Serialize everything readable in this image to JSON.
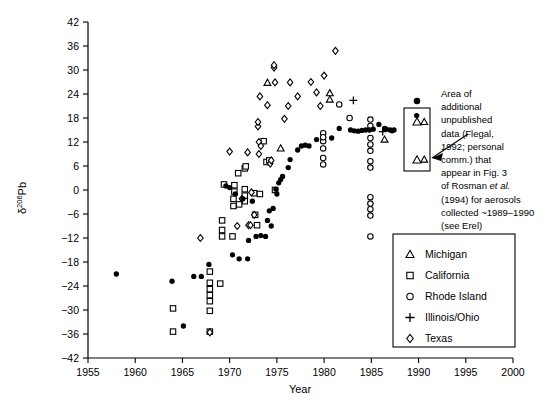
{
  "chart_data": {
    "type": "scatter",
    "title": "",
    "xlabel": "Year",
    "ylabel": "δ206Pb",
    "ylabel_base": "δ",
    "ylabel_sup": "206",
    "ylabel_tail": "Pb",
    "xlim": [
      1955,
      2000
    ],
    "ylim": [
      -42,
      42
    ],
    "xticks": [
      1955,
      1960,
      1965,
      1970,
      1975,
      1980,
      1985,
      1990,
      1995,
      2000
    ],
    "yticks": [
      -42,
      -36,
      -30,
      -24,
      -18,
      -12,
      -6,
      0,
      6,
      12,
      18,
      24,
      30,
      36,
      42
    ],
    "grid": false,
    "legend_position": "bottom-right",
    "series": [
      {
        "name": "Michigan",
        "marker": "triangle-open",
        "points": [
          [
            1974.0,
            26.8
          ],
          [
            1980.6,
            24.2
          ],
          [
            1980.6,
            22.6
          ],
          [
            1975.4,
            10.4
          ],
          [
            1986.4,
            12.6
          ],
          [
            1990.6,
            17.0
          ],
          [
            1990.6,
            7.6
          ]
        ]
      },
      {
        "name": "California",
        "marker": "square-open",
        "points": [
          [
            1964.0,
            -29.6
          ],
          [
            1964.0,
            -35.4
          ],
          [
            1967.9,
            -20.4
          ],
          [
            1967.9,
            -23.2
          ],
          [
            1967.9,
            -24.8
          ],
          [
            1967.9,
            -26.3
          ],
          [
            1967.9,
            -27.8
          ],
          [
            1967.9,
            -30.2
          ],
          [
            1967.9,
            -35.4
          ],
          [
            1969.0,
            -23.4
          ],
          [
            1969.2,
            -7.6
          ],
          [
            1969.2,
            -10.0
          ],
          [
            1969.2,
            -11.6
          ],
          [
            1970.3,
            -11.6
          ],
          [
            1970.4,
            -2.2
          ],
          [
            1970.4,
            -4.0
          ],
          [
            1970.5,
            -0.4
          ],
          [
            1970.5,
            1.2
          ],
          [
            1970.9,
            4.2
          ],
          [
            1971.6,
            0.2
          ],
          [
            1971.6,
            -1.4
          ],
          [
            1971.6,
            -2.8
          ],
          [
            1971.6,
            5.4
          ],
          [
            1971.7,
            5.9
          ],
          [
            1972.6,
            -0.8
          ],
          [
            1972.7,
            -6.2
          ],
          [
            1972.9,
            -8.8
          ],
          [
            1973.6,
            12.2
          ],
          [
            1973.9,
            7.0
          ],
          [
            1974.2,
            7.4
          ],
          [
            1969.4,
            1.4
          ],
          [
            1971.0,
            -3.6
          ],
          [
            1973.2,
            -1.0
          ],
          [
            1974.8,
            0.0
          ]
        ]
      },
      {
        "name": "Rhode Island",
        "marker": "circle-open",
        "points": [
          [
            1981.6,
            21.4
          ],
          [
            1982.7,
            18.0
          ],
          [
            1984.9,
            17.6
          ],
          [
            1984.9,
            16.0
          ],
          [
            1984.9,
            13.0
          ],
          [
            1984.9,
            11.4
          ],
          [
            1984.9,
            9.8
          ],
          [
            1984.9,
            7.2
          ],
          [
            1984.9,
            5.6
          ],
          [
            1984.9,
            -1.8
          ],
          [
            1984.9,
            -3.4
          ],
          [
            1984.9,
            -4.8
          ],
          [
            1984.9,
            -6.4
          ],
          [
            1984.9,
            -11.6
          ],
          [
            1979.9,
            14.2
          ],
          [
            1979.9,
            12.2
          ],
          [
            1979.9,
            10.4
          ],
          [
            1979.9,
            8.0
          ],
          [
            1979.9,
            6.4
          ],
          [
            1979.9,
            13.2
          ]
        ]
      },
      {
        "name": "Illinois/Ohio",
        "marker": "plus",
        "points": [
          [
            1983.1,
            22.4
          ],
          [
            1986.2,
            14.6
          ]
        ]
      },
      {
        "name": "Texas",
        "marker": "diamond-open",
        "points": [
          [
            1966.9,
            -12.0
          ],
          [
            1967.9,
            -35.6
          ],
          [
            1970.0,
            9.6
          ],
          [
            1971.9,
            9.4
          ],
          [
            1973.1,
            9.0
          ],
          [
            1973.1,
            12.0
          ],
          [
            1973.3,
            11.0
          ],
          [
            1973.0,
            15.9
          ],
          [
            1973.0,
            17.0
          ],
          [
            1973.2,
            23.4
          ],
          [
            1974.0,
            21.2
          ],
          [
            1974.7,
            30.6
          ],
          [
            1974.7,
            31.2
          ],
          [
            1974.8,
            26.9
          ],
          [
            1976.4,
            26.9
          ],
          [
            1974.3,
            6.6
          ],
          [
            1974.4,
            7.4
          ],
          [
            1972.3,
            -0.6
          ],
          [
            1972.6,
            -6.2
          ],
          [
            1972.0,
            -8.8
          ],
          [
            1972.2,
            -8.8
          ],
          [
            1970.8,
            -9.0
          ],
          [
            1971.3,
            -2.2
          ],
          [
            1980.0,
            28.6
          ],
          [
            1981.2,
            34.8
          ],
          [
            1979.2,
            24.4
          ],
          [
            1979.6,
            21.0
          ],
          [
            1978.6,
            27.0
          ],
          [
            1977.2,
            23.4
          ],
          [
            1976.2,
            21.0
          ],
          [
            1975.8,
            17.8
          ]
        ]
      },
      {
        "name": "Unlabeled filled circles",
        "marker": "circle-filled",
        "points": [
          [
            1958.0,
            -21.0
          ],
          [
            1963.9,
            -22.8
          ],
          [
            1965.1,
            -34.0
          ],
          [
            1966.2,
            -21.6
          ],
          [
            1967.0,
            -21.6
          ],
          [
            1967.8,
            -18.6
          ],
          [
            1970.3,
            -16.2
          ],
          [
            1971.0,
            -17.2
          ],
          [
            1971.9,
            -17.2
          ],
          [
            1972.0,
            -12.6
          ],
          [
            1972.8,
            -11.6
          ],
          [
            1973.3,
            -11.4
          ],
          [
            1973.8,
            -11.6
          ],
          [
            1974.2,
            -5.2
          ],
          [
            1974.6,
            -4.6
          ],
          [
            1974.9,
            0.2
          ],
          [
            1975.2,
            1.8
          ],
          [
            1975.4,
            2.6
          ],
          [
            1975.0,
            -1.0
          ],
          [
            1975.6,
            3.4
          ],
          [
            1976.2,
            5.6
          ],
          [
            1976.4,
            7.6
          ],
          [
            1974.0,
            -7.6
          ],
          [
            1974.4,
            -9.0
          ],
          [
            1977.2,
            10.0
          ],
          [
            1977.6,
            11.0
          ],
          [
            1978.0,
            11.2
          ],
          [
            1978.4,
            11.0
          ],
          [
            1979.2,
            12.6
          ],
          [
            1980.8,
            13.0
          ],
          [
            1981.6,
            15.4
          ],
          [
            1982.8,
            15.0
          ],
          [
            1983.2,
            14.8
          ],
          [
            1983.6,
            14.7
          ],
          [
            1984.0,
            14.9
          ],
          [
            1984.4,
            15.0
          ],
          [
            1984.8,
            15.0
          ],
          [
            1985.2,
            15.2
          ],
          [
            1985.8,
            16.4
          ],
          [
            1986.4,
            15.4
          ],
          [
            1986.6,
            15.2
          ],
          [
            1987.0,
            15.0
          ],
          [
            1987.2,
            14.8
          ],
          [
            1987.4,
            15.0
          ],
          [
            1989.8,
            18.6
          ],
          [
            1969.6,
            1.0
          ],
          [
            1970.0,
            0.6
          ],
          [
            1971.4,
            -2.2
          ],
          [
            1972.4,
            -2.8
          ],
          [
            1970.6,
            -1.0
          ]
        ]
      }
    ]
  },
  "legend": {
    "items": [
      {
        "label": "Michigan",
        "marker": "triangle-open"
      },
      {
        "label": "California",
        "marker": "square-open"
      },
      {
        "label": "Rhode Island",
        "marker": "circle-open"
      },
      {
        "label": "Illinois/Ohio",
        "marker": "plus"
      },
      {
        "label": "Texas",
        "marker": "diamond-open"
      }
    ]
  },
  "annotation": {
    "lines": [
      "Area of",
      "additional",
      "unpublished",
      "data (Flegal,",
      "1992; personal",
      "comm.) that",
      "appear in Fig. 3",
      "of Rosman et al.",
      "(1994) for aerosols",
      "collected ~1989–1990",
      "(see Erel)"
    ],
    "italic_line_index": 7,
    "italic_prefix": "of Rosman ",
    "italic_word": "et al.",
    "box_markers": [
      "triangle-open",
      "triangle-open"
    ]
  }
}
